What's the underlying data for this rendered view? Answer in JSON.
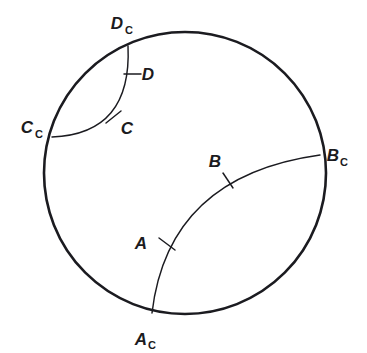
{
  "figure": {
    "kind": "geometry-diagram",
    "title": "",
    "background_color": "#ffffff",
    "stroke_color": "#1b1b20",
    "circle": {
      "name": "bounding-circle",
      "cx": 185,
      "cy": 173,
      "r": 141,
      "stroke_width": 2.6
    },
    "arcs": [
      {
        "id": "arc-a-b",
        "from": "A_C",
        "to": "B_C",
        "start": {
          "x": 152,
          "y": 313
        },
        "end": {
          "x": 320,
          "y": 155
        },
        "control": {
          "x": 168,
          "y": 176
        },
        "stroke_width": 1.4
      },
      {
        "id": "arc-c-d",
        "from": "C_C",
        "to": "D_C",
        "start": {
          "x": 52,
          "y": 137
        },
        "end": {
          "x": 128,
          "y": 46
        },
        "control": {
          "x": 132,
          "y": 134
        },
        "stroke_width": 1.4
      }
    ],
    "points": [
      {
        "id": "point-A",
        "label": "A",
        "subscript": "",
        "tick": {
          "x": 166,
          "y": 244,
          "angle": 62
        },
        "label_pos": {
          "x": 141,
          "y": 249
        }
      },
      {
        "id": "point-B",
        "label": "B",
        "subscript": "",
        "tick": {
          "x": 228,
          "y": 180,
          "angle": 118
        },
        "label_pos": {
          "x": 215,
          "y": 167
        }
      },
      {
        "id": "point-C",
        "label": "C",
        "subscript": "",
        "tick": {
          "x": 114,
          "y": 118,
          "angle": 45
        },
        "label_pos": {
          "x": 122,
          "y": 134
        }
      },
      {
        "id": "point-D",
        "label": "D",
        "subscript": "",
        "tick": {
          "x": 133,
          "y": 74,
          "angle": 90
        },
        "label_pos": {
          "x": 142,
          "y": 80
        }
      },
      {
        "id": "point-A-c",
        "label": "A",
        "subscript": "C",
        "tick": null,
        "label_pos": {
          "x": 141,
          "y": 344
        }
      },
      {
        "id": "point-B-c",
        "label": "B",
        "subscript": "C",
        "tick": null,
        "label_pos": {
          "x": 326,
          "y": 162
        }
      },
      {
        "id": "point-C-c",
        "label": "C",
        "subscript": "C",
        "tick": null,
        "label_pos": {
          "x": 20,
          "y": 133
        }
      },
      {
        "id": "point-D-c",
        "label": "D",
        "subscript": "C",
        "tick": null,
        "label_pos": {
          "x": 110,
          "y": 28
        }
      }
    ]
  }
}
